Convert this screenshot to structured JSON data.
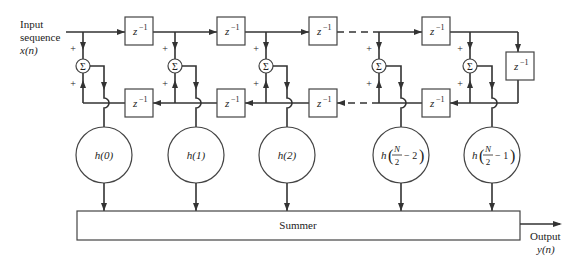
{
  "labels": {
    "input_line1": "Input",
    "input_line2": "sequence",
    "input_signal": "x(n)",
    "output_line1": "Output",
    "output_signal": "y(n)",
    "summer": "Summer",
    "delay": "z",
    "delay_exp": "−1",
    "sum_symbol": "Σ",
    "plus": "+"
  },
  "coefficients": [
    {
      "label": "h(0)"
    },
    {
      "label": "h(1)"
    },
    {
      "label": "h(2)"
    },
    {
      "label_pre": "h",
      "num": "N",
      "den": "2",
      "post": "− 2"
    },
    {
      "label_pre": "h",
      "num": "N",
      "den": "2",
      "post": "− 1"
    }
  ],
  "colors": {
    "stroke": "#333333",
    "background": "#ffffff"
  }
}
